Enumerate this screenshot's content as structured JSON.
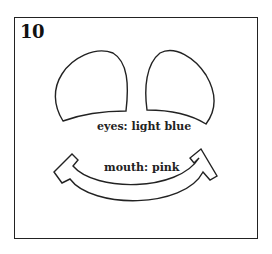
{
  "page": {
    "number": "10",
    "cut_text": "..."
  },
  "labels": {
    "eyes": "eyes: light blue",
    "mouth": "mouth: pink"
  },
  "shapes": {
    "left_eye": "eye-outline",
    "right_eye": "eye-outline",
    "mouth": "smile-outline"
  },
  "colors": {
    "stroke": "#222222",
    "background": "#ffffff"
  }
}
